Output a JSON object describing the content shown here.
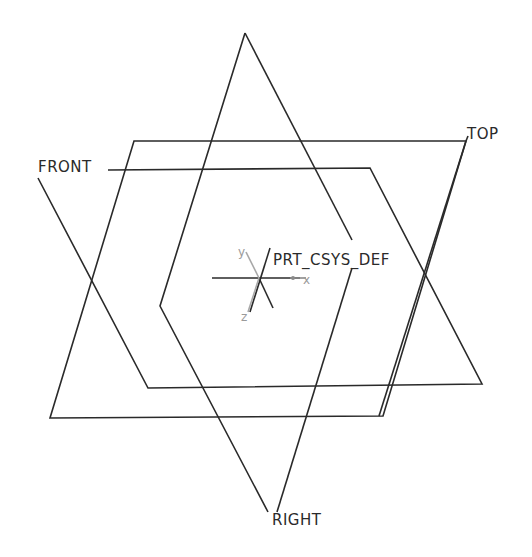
{
  "view": {
    "background": "#ffffff",
    "line_color": "#2a2a2a",
    "faint_axis_color": "#a8a8a8"
  },
  "datum_planes": [
    {
      "name": "TOP",
      "label": "TOP"
    },
    {
      "name": "FRONT",
      "label": "FRONT"
    },
    {
      "name": "RIGHT",
      "label": "RIGHT"
    }
  ],
  "coordinate_system": {
    "label": "PRT_CSYS_DEF",
    "axes": {
      "x": "x",
      "y": "y",
      "z": "z"
    }
  }
}
